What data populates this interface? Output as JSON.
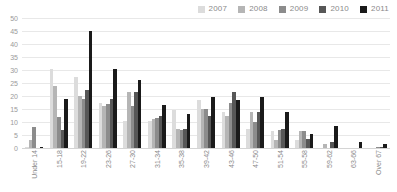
{
  "chart_data": {
    "type": "bar",
    "title": "",
    "subtitle": "",
    "xlabel": "",
    "ylabel": "",
    "ylim": [
      0,
      50
    ],
    "yticks": [
      0,
      5,
      10,
      15,
      20,
      25,
      30,
      35,
      40,
      45,
      50
    ],
    "grid": true,
    "legend_position": "top-right",
    "categories": [
      "Under 14",
      "15-18",
      "19-22",
      "23-26",
      "27-30",
      "31-34",
      "35-38",
      "39-42",
      "43-46",
      "47-50",
      "51-54",
      "55-58",
      "59-62",
      "63-66",
      "Over 67"
    ],
    "series": [
      {
        "name": "2007",
        "color": "#dcdcdc",
        "values": [
          0.3,
          30.5,
          27.5,
          17.5,
          10.5,
          10.5,
          14.5,
          18.5,
          14.0,
          7.5,
          6.5,
          3.0,
          0.0,
          0.0,
          0.0
        ]
      },
      {
        "name": "2008",
        "color": "#b5b5b5",
        "values": [
          3.0,
          24.0,
          20.0,
          16.0,
          21.5,
          11.0,
          7.5,
          15.0,
          12.5,
          14.0,
          3.0,
          6.5,
          1.5,
          0.0,
          0.0
        ]
      },
      {
        "name": "2009",
        "color": "#8c8c8c",
        "values": [
          8.0,
          12.0,
          19.0,
          17.0,
          16.0,
          11.5,
          7.0,
          15.0,
          17.5,
          10.0,
          7.0,
          6.5,
          0.0,
          0.0,
          0.5
        ]
      },
      {
        "name": "2010",
        "color": "#575757",
        "values": [
          0.0,
          7.0,
          22.5,
          19.0,
          21.5,
          12.5,
          7.5,
          12.5,
          21.5,
          14.0,
          7.5,
          3.5,
          2.5,
          0.0,
          0.5
        ]
      },
      {
        "name": "2011",
        "color": "#1a1a1a",
        "values": [
          0.3,
          19.0,
          45.0,
          30.5,
          26.0,
          16.5,
          13.0,
          19.5,
          18.5,
          19.5,
          14.0,
          5.5,
          8.5,
          2.5,
          1.5
        ]
      }
    ]
  },
  "axis": {
    "y_tick_labels": [
      "50",
      "45",
      "40",
      "35",
      "30",
      "25",
      "20",
      "15",
      "10",
      "5",
      "0"
    ]
  }
}
